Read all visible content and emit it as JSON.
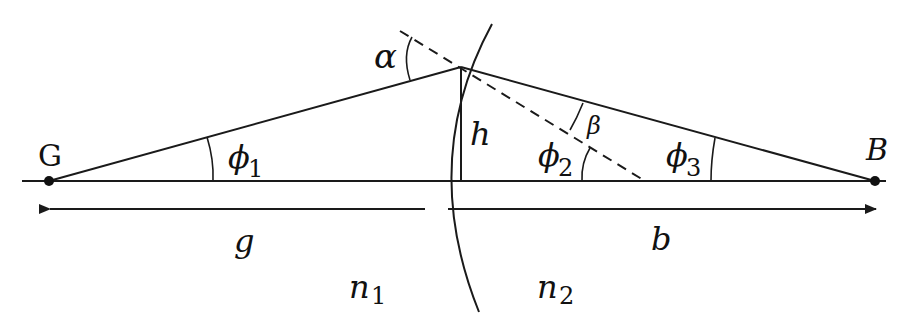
{
  "diagram": {
    "type": "refraction-at-spherical-surface",
    "colors": {
      "line": "#1a1a1a",
      "background": "#ffffff"
    },
    "labels": {
      "object_point": "G",
      "image_point": "B",
      "alpha": "α",
      "beta": "β",
      "height": "h",
      "phi1": "ϕ",
      "phi1_sub": "1",
      "phi2": "ϕ",
      "phi2_sub": "2",
      "phi3": "ϕ",
      "phi3_sub": "3",
      "object_distance": "g",
      "image_distance": "b",
      "n1": "n",
      "n1_sub": "1",
      "n2": "n",
      "n2_sub": "2"
    },
    "elements": [
      "optical-axis",
      "object-point-G",
      "image-point-B",
      "incident-ray",
      "refracted-ray",
      "surface-normal-dashed",
      "spherical-interface-arc",
      "height-line-h",
      "distance-arrow-g",
      "distance-arrow-b"
    ]
  }
}
